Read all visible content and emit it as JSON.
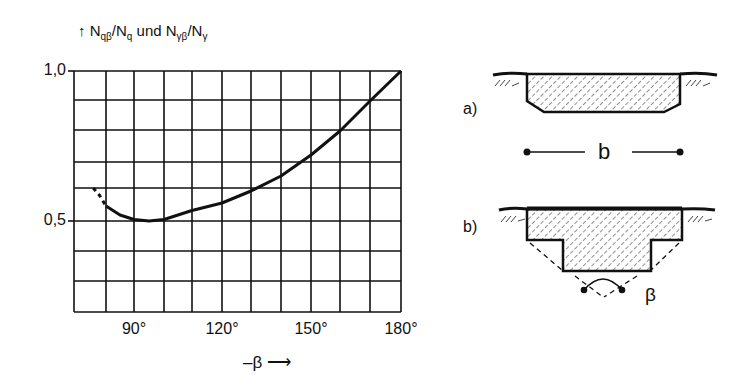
{
  "chart_data": {
    "type": "line",
    "title": "",
    "ylabel": "N_qβ/N_q und N_γβ/N_γ",
    "xlabel": "-β",
    "x_unit": "°",
    "xlim": [
      70,
      180
    ],
    "ylim": [
      0.2,
      1.0
    ],
    "grid": true,
    "xticks": [
      90,
      120,
      150,
      180
    ],
    "xtick_labels": [
      "90°",
      "120°",
      "150°",
      "180°"
    ],
    "yticks": [
      0.5,
      1.0
    ],
    "ytick_labels": [
      "0,5",
      "1,0"
    ],
    "series": [
      {
        "name": "N_qβ/N_q und N_γβ/N_γ",
        "x": [
          76,
          78,
          80,
          85,
          90,
          95,
          100,
          110,
          120,
          130,
          140,
          150,
          160,
          170,
          180
        ],
        "y": [
          0.61,
          0.585,
          0.55,
          0.52,
          0.505,
          0.5,
          0.505,
          0.535,
          0.56,
          0.6,
          0.65,
          0.72,
          0.8,
          0.9,
          1.0
        ],
        "dashed_until_x": 80
      }
    ]
  },
  "labels": {
    "ylabel_main": "N",
    "ylabel_sub1": "qβ",
    "ylabel_mid": "/N",
    "ylabel_sub2": "q",
    "ylabel_und": " und N",
    "ylabel_sub3": "γβ",
    "ylabel_mid2": "/N",
    "ylabel_sub4": "γ",
    "y_top": "1,0",
    "y_mid": "0,5",
    "x_90": "90°",
    "x_120": "120°",
    "x_150": "150°",
    "x_180": "180°",
    "x_axis": "–β ⟶"
  },
  "figures": {
    "a": {
      "label": "a)",
      "dimension": "b"
    },
    "b": {
      "label": "b)",
      "angle": "β"
    }
  }
}
